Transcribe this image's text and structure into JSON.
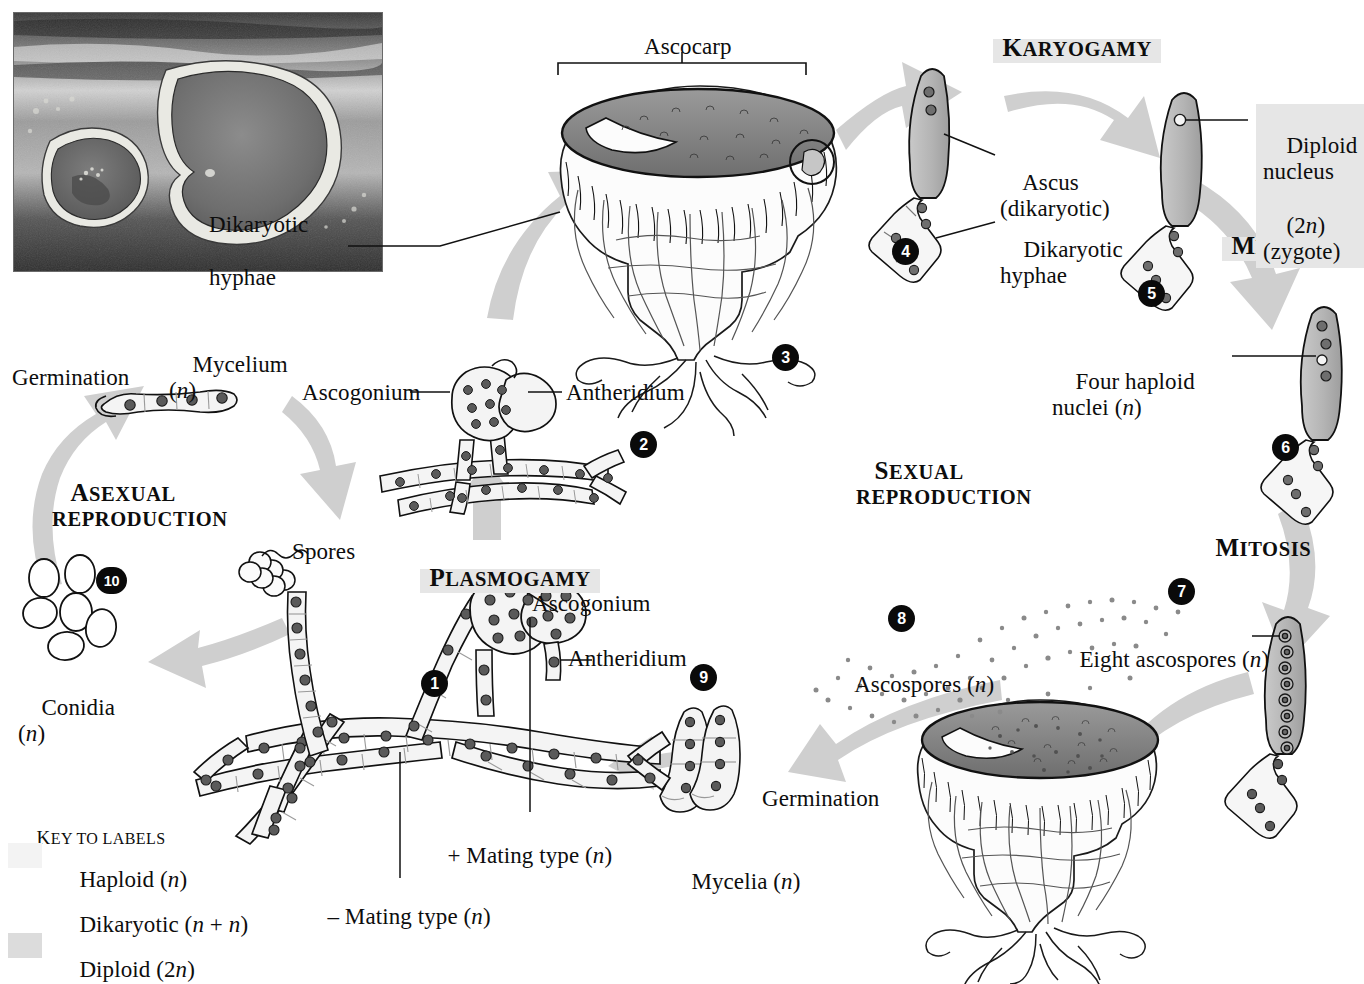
{
  "figure": {
    "photo_caption": ""
  },
  "phase_headings": {
    "karyogamy": "Karyogamy",
    "meiosis": "Meiosis",
    "mitosis": "Mitosis",
    "plasmogamy": "Plasmogamy",
    "sexual_reproduction_line1": "Sexual",
    "sexual_reproduction_line2": "reproduction",
    "asexual_reproduction_line1": "Asexual",
    "asexual_reproduction_line2": "reproduction"
  },
  "labels": {
    "ascocarp": "Ascocarp",
    "dikaryotic_hyphae_top_l1": "Dikaryotic",
    "dikaryotic_hyphae_top_l2": "hyphae",
    "ascus_l1": "Ascus",
    "ascus_l2": "(dikaryotic)",
    "dikaryotic_hyphae_r_l1": "Dikaryotic",
    "dikaryotic_hyphae_r_l2": "hyphae",
    "diploid_nucleus_l1": "Diploid",
    "diploid_nucleus_l2": "nucleus",
    "diploid_nucleus_l3": "(2n)",
    "diploid_nucleus_l4": "(zygote)",
    "four_haploid_l1": "Four haploid",
    "four_haploid_l2": "nuclei (n)",
    "eight_ascospores": "Eight ascospores (n)",
    "ascospores": "Ascospores (n)",
    "germination_right": "Germination",
    "mycelia": "Mycelia (n)",
    "ascogonium_top": "Ascogonium",
    "antheridium_top": "Antheridium",
    "ascogonium_bottom": "Ascogonium",
    "antheridium_bottom": "Antheridium",
    "plus_mating_type": "+ Mating type (n)",
    "minus_mating_type": "– Mating type (n)",
    "spores": "Spores",
    "conidia_l1": "Conidia",
    "conidia_l2": "(n)",
    "mycelium_l1": "Mycelium",
    "mycelium_l2": "(n)",
    "germination_left": "Germination"
  },
  "steps": [
    {
      "n": "1"
    },
    {
      "n": "2"
    },
    {
      "n": "3"
    },
    {
      "n": "4"
    },
    {
      "n": "5"
    },
    {
      "n": "6"
    },
    {
      "n": "7"
    },
    {
      "n": "8"
    },
    {
      "n": "9"
    },
    {
      "n": "10"
    }
  ],
  "step_numbers": {
    "s1": "1",
    "s2": "2",
    "s3": "3",
    "s4": "4",
    "s5": "5",
    "s6": "6",
    "s7": "7",
    "s8": "8",
    "s9": "9",
    "s10": "10"
  },
  "key": {
    "title": "Key to labels",
    "items": [
      {
        "label": "Haploid (n)",
        "swatch": "#f3f3f3"
      },
      {
        "label": "Dikaryotic (n + n)",
        "swatch": "#ffffff"
      },
      {
        "label": "Diploid (2n)",
        "swatch": "#dcdcdc"
      }
    ],
    "haploid": "Haploid (n)",
    "dikaryotic": "Dikaryotic (n + n)",
    "diploid": "Diploid (2n)"
  },
  "colors": {
    "ink": "#0d0d0d",
    "arrow_gray": "#cfcfcf",
    "highlight_gray": "#e6e6e6",
    "haploid_fill": "#f3f3f3",
    "dikaryotic_fill": "#ffffff",
    "diploid_fill": "#dcdcdc",
    "hymenium_dark": "#8a8a8a",
    "nucleus_gray": "#6e6e6e"
  }
}
